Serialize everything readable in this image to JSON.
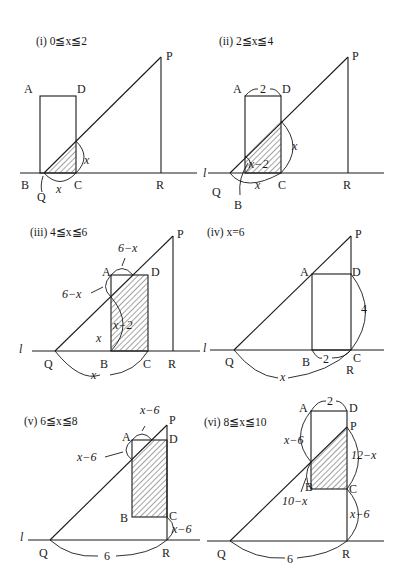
{
  "panels": [
    {
      "id": "i",
      "title": "(i)  0≦x≦2",
      "labels": {
        "A": "A",
        "D": "D",
        "P": "P",
        "B": "B",
        "C": "C",
        "R": "R",
        "Q": "Q"
      },
      "measures": {
        "vertical": "x",
        "horizontal": "x"
      }
    },
    {
      "id": "ii",
      "title": "(ii)  2≦x≦4",
      "labels": {
        "A": "A",
        "D": "D",
        "P": "P",
        "l": "l",
        "Q": "Q",
        "B": "B",
        "C": "C",
        "R": "R"
      },
      "measures": {
        "top": "2",
        "vertical": "x",
        "inner": "x−2",
        "horizontal": "x"
      }
    },
    {
      "id": "iii",
      "title": "(iii)  4≦x≦6",
      "labels": {
        "A": "A",
        "D": "D",
        "P": "P",
        "l": "l",
        "Q": "Q",
        "B": "B",
        "C": "C",
        "R": "R"
      },
      "measures": {
        "top": "6−x",
        "left": "6−x",
        "inner": "x−2",
        "height": "x",
        "horizontal": "x"
      }
    },
    {
      "id": "iv",
      "title": "(iv)  x=6",
      "labels": {
        "A": "A",
        "D": "D",
        "P": "P",
        "l": "l",
        "Q": "Q",
        "B": "B",
        "C": "C",
        "R": "R"
      },
      "measures": {
        "vertical": "4",
        "bottom": "2",
        "horizontal": "x"
      }
    },
    {
      "id": "v",
      "title": "(v)  6≦x≦8",
      "labels": {
        "A": "A",
        "D": "D",
        "P": "P",
        "l": "l",
        "Q": "Q",
        "B": "B",
        "C": "C",
        "R": "R"
      },
      "measures": {
        "top": "x−6",
        "left": "x−6",
        "right": "x−6",
        "horizontal": "6"
      }
    },
    {
      "id": "vi",
      "title": "(vi)  8≦x≦10",
      "labels": {
        "A": "A",
        "D": "D",
        "P": "P",
        "Q": "Q",
        "B": "B",
        "C": "C",
        "R": "R"
      },
      "measures": {
        "top": "2",
        "left": "x−6",
        "right": "12−x",
        "lower_left": "10−x",
        "lower_right": "x−6",
        "horizontal": "6"
      }
    }
  ]
}
